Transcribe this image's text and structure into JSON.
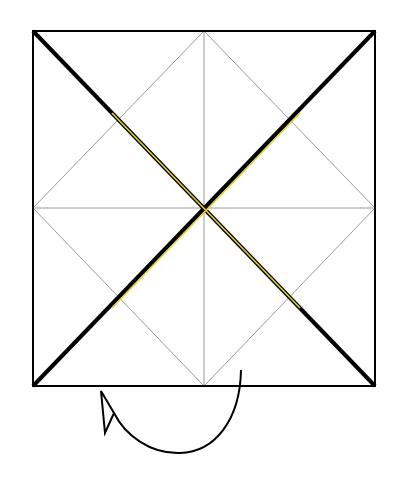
{
  "diagram": {
    "type": "origami-fold-diagram",
    "square": {
      "x1": 33,
      "y1": 31,
      "x2": 375,
      "y2": 386
    },
    "colors": {
      "outline": "#000000",
      "crease": "#9a9a9a",
      "highlight": "#e6d22a",
      "arrow": "#000000",
      "background": "#ffffff"
    },
    "arrow": {
      "meaning": "turn-over",
      "direction": "counter-clockwise"
    }
  }
}
